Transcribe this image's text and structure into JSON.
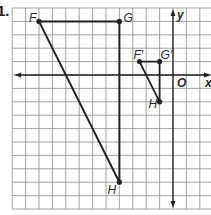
{
  "problem_number": "1.",
  "grid": {
    "origin_px": [
      173,
      75
    ],
    "cell_px": 13.4,
    "x_range": [
      -12,
      3
    ],
    "y_range": [
      -10,
      5
    ],
    "line_color": "#8c8c8c",
    "axis_color": "#222222"
  },
  "axes": {
    "x_label": "x",
    "y_label": "y",
    "origin_label": "O"
  },
  "original_triangle": {
    "vertices": [
      {
        "name": "F",
        "x": -10,
        "y": 4
      },
      {
        "name": "G",
        "x": -4,
        "y": 4
      },
      {
        "name": "H",
        "x": -4,
        "y": -8
      }
    ]
  },
  "image_triangle": {
    "vertices": [
      {
        "name": "F'",
        "x": -2.5,
        "y": 1
      },
      {
        "name": "G'",
        "x": -1,
        "y": 1
      },
      {
        "name": "H'",
        "x": -1,
        "y": -2
      }
    ]
  },
  "stroke_color": "#222222"
}
